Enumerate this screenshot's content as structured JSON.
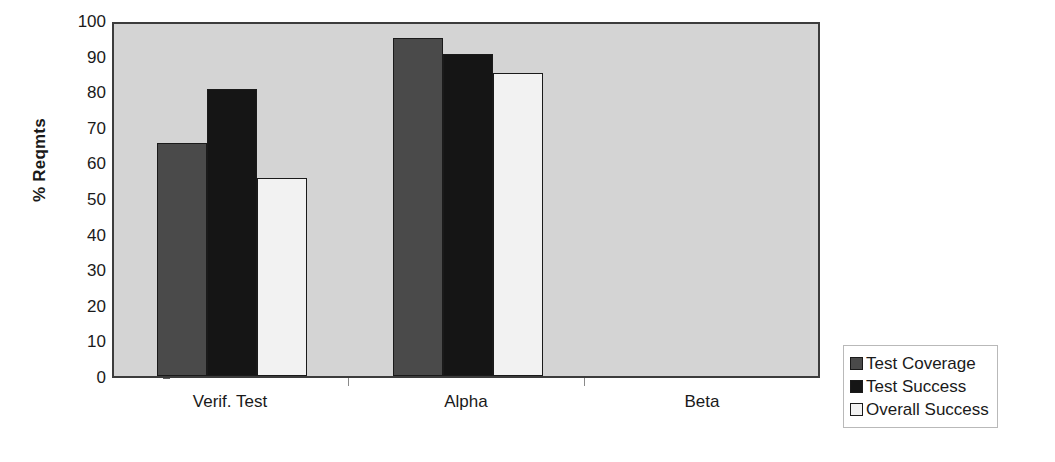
{
  "chart_data": {
    "type": "bar",
    "title": "",
    "subtitle": "",
    "xlabel": "",
    "ylabel": "% Reqmts",
    "categories": [
      "Verif. Test",
      "Alpha",
      "Beta"
    ],
    "series": [
      {
        "name": "Test Coverage",
        "color": "#4a4a4a",
        "values": [
          65.5,
          95.0,
          null
        ]
      },
      {
        "name": "Test Success",
        "color": "#151515",
        "values": [
          80.5,
          90.5,
          null
        ]
      },
      {
        "name": "Overall Success",
        "color": "#f2f2f2",
        "values": [
          55.5,
          85.0,
          null
        ]
      }
    ],
    "ylim": [
      0,
      100
    ],
    "y_ticks": [
      0,
      10,
      20,
      30,
      40,
      50,
      60,
      70,
      80,
      90,
      100
    ],
    "y_tick_labels": [
      "0",
      "10",
      "20",
      "30",
      "40",
      "50",
      "60",
      "70",
      "80",
      "90",
      "100"
    ],
    "grid": false,
    "legend_position": "right-bottom",
    "plot_background": "#d4d4d4",
    "figure_background": "#ffffff",
    "axis_color": "#3c3c3c",
    "text_color": "#1a1a1a"
  },
  "legend": {
    "items": [
      {
        "label": "Test Coverage",
        "swatch_name": "legend-swatch-test-coverage",
        "color": "#4a4a4a"
      },
      {
        "label": "Test Success",
        "swatch_name": "legend-swatch-test-success",
        "color": "#151515"
      },
      {
        "label": "Overall Success",
        "swatch_name": "legend-swatch-overall-success",
        "color": "#f2f2f2"
      }
    ]
  }
}
